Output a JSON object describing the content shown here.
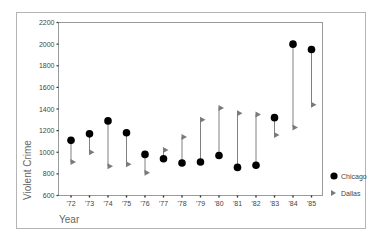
{
  "chart_data": {
    "type": "scatter",
    "subtype": "dumbbell",
    "title": "",
    "xlabel": "Year",
    "ylabel": "Violent Crime",
    "categories": [
      "'72",
      "'73",
      "'74",
      "'75",
      "'76",
      "'77",
      "'78",
      "'79",
      "'80",
      "'81",
      "'82",
      "'83",
      "'84",
      "'85"
    ],
    "ylim": [
      600,
      2200
    ],
    "yticks": [
      600,
      800,
      1000,
      1200,
      1400,
      1600,
      1800,
      2000,
      2200
    ],
    "grid": false,
    "legend_position": "right",
    "series": [
      {
        "name": "Chicago",
        "marker": "circle",
        "color": "#000000",
        "values": [
          1110,
          1170,
          1290,
          1180,
          980,
          940,
          900,
          910,
          970,
          860,
          880,
          1320,
          2000,
          1950
        ]
      },
      {
        "name": "Dallas",
        "marker": "triangle-right",
        "color": "#7a7a7a",
        "values": [
          910,
          1000,
          870,
          890,
          810,
          1020,
          1140,
          1300,
          1410,
          1360,
          1350,
          1160,
          1230,
          1440
        ]
      }
    ],
    "connector_color": "#808080"
  },
  "legend": {
    "items": [
      {
        "label": "Chicago"
      },
      {
        "label": "Dallas"
      }
    ]
  },
  "axes": {
    "x_title": "Year",
    "y_title": "Violent Crime"
  }
}
